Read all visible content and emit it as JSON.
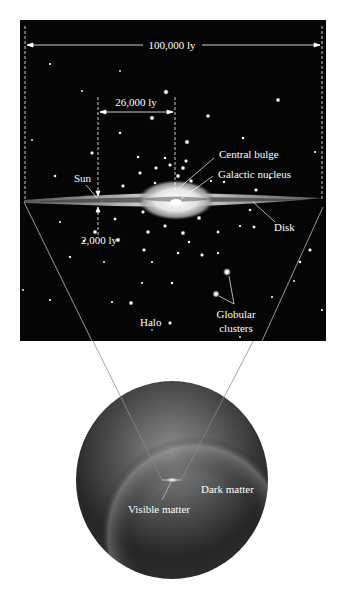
{
  "diagram": {
    "colors": {
      "background": "#ffffff",
      "panel": "#050505",
      "label": "#ffffff",
      "line": "#7a7a7a",
      "sphere_light": "#8a8a8a",
      "sphere_dark": "#1e1e1e"
    },
    "dimensions": {
      "galaxy_diameter": "100,000 ly",
      "sun_to_center": "26,000 ly",
      "disk_thickness": "2,000 ly"
    },
    "labels": {
      "central_bulge": "Central bulge",
      "galactic_nucleus": "Galactic nucleus",
      "sun": "Sun",
      "disk": "Disk",
      "halo": "Halo",
      "globular_line1": "Globular",
      "globular_line2": "clusters",
      "dark_matter": "Dark matter",
      "visible_matter": "Visible matter"
    },
    "stars": [
      [
        50,
        64,
        0.8
      ],
      [
        120,
        71,
        0.7
      ],
      [
        82,
        91,
        0.7
      ],
      [
        166,
        92,
        1.6
      ],
      [
        278,
        100,
        1.4
      ],
      [
        152,
        118,
        1.5
      ],
      [
        208,
        116,
        1.3
      ],
      [
        120,
        133,
        1.0
      ],
      [
        32,
        140,
        0.7
      ],
      [
        243,
        138,
        1.0
      ],
      [
        187,
        142,
        1.5
      ],
      [
        92,
        153,
        1.2
      ],
      [
        138,
        157,
        1.0
      ],
      [
        165,
        158,
        1.0
      ],
      [
        186,
        161,
        1.2
      ],
      [
        315,
        152,
        0.8
      ],
      [
        170,
        165,
        1.2
      ],
      [
        156,
        168,
        1.2
      ],
      [
        183,
        168,
        1.4
      ],
      [
        140,
        173,
        1.2
      ],
      [
        178,
        176,
        1.4
      ],
      [
        123,
        186,
        1.2
      ],
      [
        155,
        183,
        1.0
      ],
      [
        191,
        181,
        1.3
      ],
      [
        211,
        181,
        0.9
      ],
      [
        270,
        178,
        0.8
      ],
      [
        256,
        190,
        1.2
      ],
      [
        224,
        182,
        1.0
      ],
      [
        143,
        212,
        1.2
      ],
      [
        115,
        219,
        1.1
      ],
      [
        199,
        218,
        1.4
      ],
      [
        165,
        226,
        1.2
      ],
      [
        148,
        232,
        1.3
      ],
      [
        218,
        232,
        1.1
      ],
      [
        95,
        232,
        1.4
      ],
      [
        84,
        241,
        1.0
      ],
      [
        118,
        240,
        1.5
      ],
      [
        254,
        227,
        1.1
      ],
      [
        183,
        233,
        1.4
      ],
      [
        240,
        226,
        0.9
      ],
      [
        189,
        242,
        1.0
      ],
      [
        144,
        250,
        1.2
      ],
      [
        178,
        253,
        1.0
      ],
      [
        310,
        250,
        1.2
      ],
      [
        202,
        255,
        1.2
      ],
      [
        70,
        257,
        0.9
      ],
      [
        218,
        253,
        0.9
      ],
      [
        104,
        262,
        0.7
      ],
      [
        152,
        262,
        0.8
      ],
      [
        227,
        272,
        2.2
      ],
      [
        172,
        283,
        1.0
      ],
      [
        142,
        283,
        0.8
      ],
      [
        216,
        294,
        2.0
      ],
      [
        23,
        290,
        0.7
      ],
      [
        50,
        300,
        0.8
      ],
      [
        131,
        303,
        1.4
      ],
      [
        170,
        323,
        1.2
      ],
      [
        112,
        302,
        0.8
      ],
      [
        272,
        297,
        0.8
      ],
      [
        322,
        310,
        0.8
      ],
      [
        240,
        337,
        0.7
      ],
      [
        152,
        330,
        0.6
      ],
      [
        294,
        281,
        0.7
      ],
      [
        55,
        176,
        1.0
      ],
      [
        102,
        201,
        1.3
      ],
      [
        250,
        210,
        1.0
      ],
      [
        60,
        222,
        0.8
      ],
      [
        300,
        262,
        1.0
      ]
    ]
  }
}
